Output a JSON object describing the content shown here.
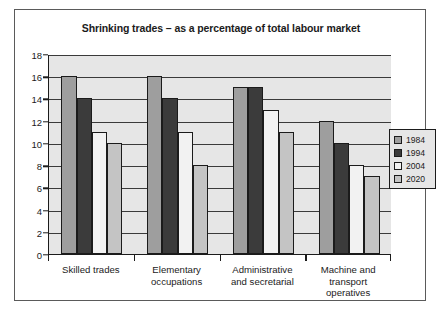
{
  "chart_data": {
    "type": "bar",
    "title": "Shrinking trades – as a percentage of total labour market",
    "xlabel": "",
    "ylabel": "",
    "ylim": [
      0,
      18
    ],
    "ytick_step": 2,
    "yticks": [
      "0",
      "2",
      "4",
      "6",
      "8",
      "10",
      "12",
      "14",
      "16",
      "18"
    ],
    "grid": true,
    "legend_position": "right",
    "categories": [
      "Skilled trades",
      "Elementary occupations",
      "Administrative and secretarial",
      "Machine and transport operatives"
    ],
    "category_lines": [
      [
        "Skilled trades"
      ],
      [
        "Elementary",
        "occupations"
      ],
      [
        "Administrative",
        "and secretarial"
      ],
      [
        "Machine and",
        "transport",
        "operatives"
      ]
    ],
    "series": [
      {
        "name": "1984",
        "color": "#9e9e9e",
        "values": [
          16,
          16,
          15,
          12
        ]
      },
      {
        "name": "1994",
        "color": "#3b3b3b",
        "values": [
          14,
          14,
          15,
          10
        ]
      },
      {
        "name": "2004",
        "color": "#f2f2f2",
        "values": [
          11,
          11,
          13,
          8
        ]
      },
      {
        "name": "2020",
        "color": "#c4c4c4",
        "values": [
          10,
          8,
          11,
          7
        ]
      }
    ]
  },
  "legend": {
    "items": [
      {
        "label": "1984",
        "color": "#9e9e9e"
      },
      {
        "label": "1994",
        "color": "#3b3b3b"
      },
      {
        "label": "2004",
        "color": "#f2f2f2"
      },
      {
        "label": "2020",
        "color": "#c4c4c4"
      }
    ]
  }
}
